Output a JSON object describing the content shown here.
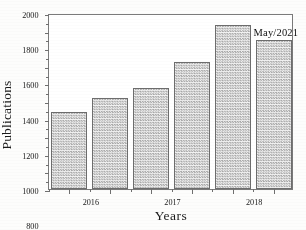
{
  "chart_data": {
    "type": "bar",
    "title": "",
    "subtitle": "",
    "xlabel": "Years",
    "ylabel": "Publications",
    "categories": [
      "2016",
      "2017",
      "2018",
      "2019",
      "2020",
      "2021"
    ],
    "values": [
      880,
      1030,
      1150,
      1440,
      1860,
      1690
    ],
    "series": [
      {
        "name": "Publications",
        "values": [
          880,
          1030,
          1150,
          1440,
          1860,
          1690
        ]
      }
    ],
    "ylim": [
      0,
      2000
    ],
    "ytick_labels": [
      "0",
      "200",
      "400",
      "600",
      "800",
      "1000",
      "1200",
      "1400",
      "1600",
      "1800",
      "2000"
    ],
    "ytick_values": [
      0,
      200,
      400,
      600,
      800,
      1000,
      1200,
      1400,
      1600,
      1800,
      2000
    ],
    "y_minor_step": 100,
    "xtick_labels": [
      "2016",
      "2017",
      "2018",
      "2019",
      "2020",
      "2021"
    ],
    "grid": false,
    "legend": false,
    "legend_position": "none",
    "annotations": [
      {
        "text": "May/2021",
        "target_category": "2021",
        "position": "above-right-bar"
      }
    ],
    "bar_style": {
      "fill": "#e3e3e3",
      "hatch": "checker",
      "edge_color": "#6d6d6d"
    },
    "frame": {
      "color": "#7a7a7a",
      "all_sides": true
    }
  }
}
